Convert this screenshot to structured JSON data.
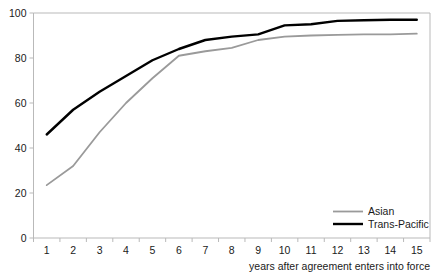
{
  "chart_data": {
    "type": "line",
    "title": "",
    "xlabel": "years after agreement enters into force",
    "ylabel": "",
    "x": [
      1,
      2,
      3,
      4,
      5,
      6,
      7,
      8,
      9,
      10,
      11,
      12,
      13,
      14,
      15
    ],
    "xtick_labels": [
      "1",
      "2",
      "3",
      "4",
      "5",
      "6",
      "7",
      "8",
      "9",
      "10",
      "11",
      "12",
      "13",
      "14",
      "15"
    ],
    "ytick_labels": [
      "0",
      "20",
      "40",
      "60",
      "80",
      "100"
    ],
    "yticks": [
      0,
      20,
      40,
      60,
      80,
      100
    ],
    "ylim": [
      0,
      100
    ],
    "xlim": [
      1,
      15
    ],
    "grid": false,
    "legend_position": "bottom-right",
    "series": [
      {
        "name": "Asian",
        "color": "#9a9a9a",
        "values": [
          23.5,
          32,
          47,
          60,
          71,
          81,
          83,
          84.5,
          88,
          89.5,
          90,
          90.3,
          90.5,
          90.5,
          90.8
        ]
      },
      {
        "name": "Trans-Pacific",
        "color": "#000000",
        "values": [
          46,
          57,
          65,
          72,
          79,
          84,
          88,
          89.5,
          90.5,
          94.5,
          95,
          96.5,
          96.8,
          97,
          97
        ]
      }
    ]
  },
  "legend": {
    "items": [
      {
        "label": "Asian",
        "color": "#9a9a9a"
      },
      {
        "label": "Trans-Pacific",
        "color": "#000000"
      }
    ]
  },
  "axis": {
    "x_title": "years after agreement enters into force"
  }
}
